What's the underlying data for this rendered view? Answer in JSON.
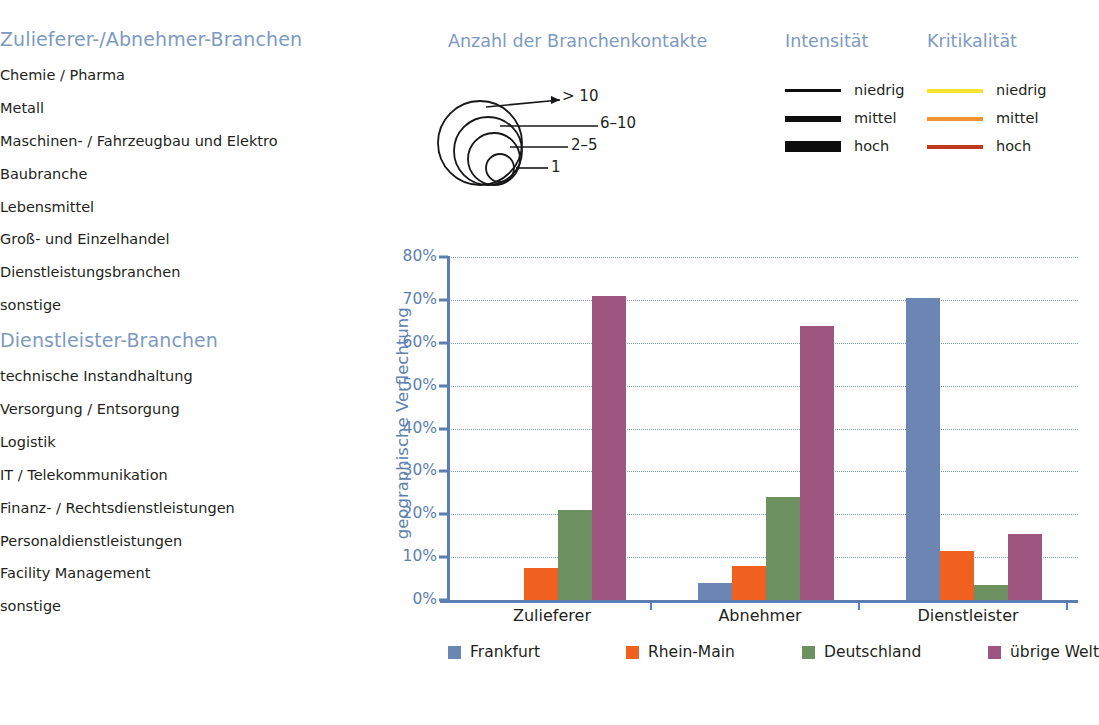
{
  "branch_column": {
    "section1": {
      "heading": "Zulieferer-/Abnehmer-Branchen",
      "items": [
        "Chemie / Pharma",
        "Metall",
        "Maschinen- / Fahrzeugbau und Elektro",
        "Baubranche",
        "Lebensmittel",
        "Groß- und Einzelhandel",
        "Dienstleistungsbranchen",
        "sonstige"
      ]
    },
    "section2": {
      "heading": "Dienstleister-Branchen",
      "items": [
        "technische Instandhaltung",
        "Versorgung / Entsorgung",
        "Logistik",
        "IT / Telekommunikation",
        "Finanz- / Rechtsdienstleistungen",
        "Personaldienstleistungen",
        "Facility Management",
        "sonstige"
      ]
    }
  },
  "bubble_legend": {
    "title": "Anzahl der Branchenkontakte",
    "entries": [
      {
        "label": "> 10"
      },
      {
        "label": "6–10"
      },
      {
        "label": "2–5"
      },
      {
        "label": "1"
      }
    ]
  },
  "intensity_legend": {
    "title": "Intensität",
    "entries": [
      {
        "label": "niedrig",
        "color": "#0d0d0d",
        "thickness": 3
      },
      {
        "label": "mittel",
        "color": "#0d0d0d",
        "thickness": 6
      },
      {
        "label": "hoch",
        "color": "#0d0d0d",
        "thickness": 11
      }
    ]
  },
  "criticality_legend": {
    "title": "Kritikalität",
    "entries": [
      {
        "label": "niedrig",
        "color": "#f9e230"
      },
      {
        "label": "mittel",
        "color": "#f29233"
      },
      {
        "label": "hoch",
        "color": "#bf3a1b"
      }
    ]
  },
  "chart_data": {
    "type": "bar",
    "title": "",
    "xlabel": "",
    "ylabel": "geographische Verflechtung",
    "categories": [
      "Zulieferer",
      "Abnehmer",
      "Dienstleister"
    ],
    "series": [
      {
        "name": "Frankfurt",
        "color": "#6b86b3",
        "values": [
          0,
          4,
          70.5
        ]
      },
      {
        "name": "Rhein-Main",
        "color": "#f0601e",
        "values": [
          7.5,
          8,
          11.5
        ]
      },
      {
        "name": "Deutschland",
        "color": "#6e9162",
        "values": [
          21,
          24,
          3.5
        ]
      },
      {
        "name": "übrige Welt",
        "color": "#9e5580",
        "values": [
          71,
          64,
          15.3
        ]
      }
    ],
    "ylim": [
      0,
      80
    ],
    "ytick_labels": [
      "0%",
      "10%",
      "20%",
      "30%",
      "40%",
      "50%",
      "60%",
      "70%",
      "80%"
    ],
    "ytick_values": [
      0,
      10,
      20,
      30,
      40,
      50,
      60,
      70,
      80
    ],
    "grid": true,
    "legend_position": "bottom"
  },
  "colors": {
    "heading_blue": "#7d9ac0",
    "axis_blue": "#5d80ae",
    "text_dark": "#231f20"
  }
}
